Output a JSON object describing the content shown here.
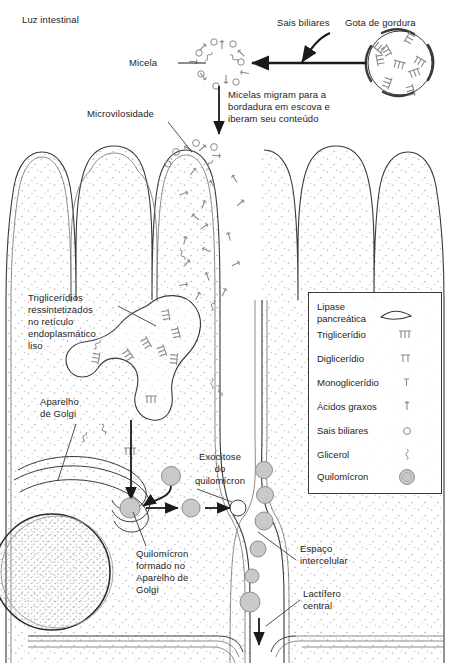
{
  "diagram": {
    "title_context": "Absorcao de lipideos no enterocito",
    "labels": {
      "lumen": "Luz intestinal",
      "bile_salts": "Sais biliares",
      "fat_droplet": "Gota de gordura",
      "micelle": "Micela",
      "migration_note": "Micelas migram para a\nbordadura em escova e\niberam seu conteúdo",
      "microvillus": "Microvilosidade",
      "smooth_er": "Triglicerídios\nressintetizados\nno retículo\nendoplasmático\nliso",
      "golgi": "Aparelho\nde Golgi",
      "exocytosis": "Exocitose\ndo\nquilomícron",
      "chylomicron_formed": "Quilomícron\nformado no\nAparelho de\nGolgi",
      "intercellular_space": "Espaço\nintercelular",
      "central_lacteal": "Lactífero\ncentral"
    }
  },
  "legend": {
    "items": [
      {
        "label": "Lipase\npancreática",
        "icon": "lipase-arc-icon"
      },
      {
        "label": "Triglicerídio",
        "icon": "triglyceride-icon"
      },
      {
        "label": "Diglicerídio",
        "icon": "diglyceride-icon"
      },
      {
        "label": "Monoglicerídio",
        "icon": "monoglyceride-icon"
      },
      {
        "label": "Ácidos graxos",
        "icon": "fatty-acid-icon"
      },
      {
        "label": "Sais biliares",
        "icon": "bile-salt-icon"
      },
      {
        "label": "Glicerol",
        "icon": "glycerol-icon"
      },
      {
        "label": "Quilomícron",
        "icon": "chylomicron-icon"
      }
    ]
  },
  "colors": {
    "line": "#3a3a3a",
    "light_line": "#6f6f6f",
    "stipple": "#b9b9c4",
    "chylomicron_fill": "#c9c9c9",
    "chylomicron_stroke": "#8e8e8e",
    "glyph": "#8a8a8a",
    "text": "#1d1d1d",
    "background": "#ffffff"
  }
}
